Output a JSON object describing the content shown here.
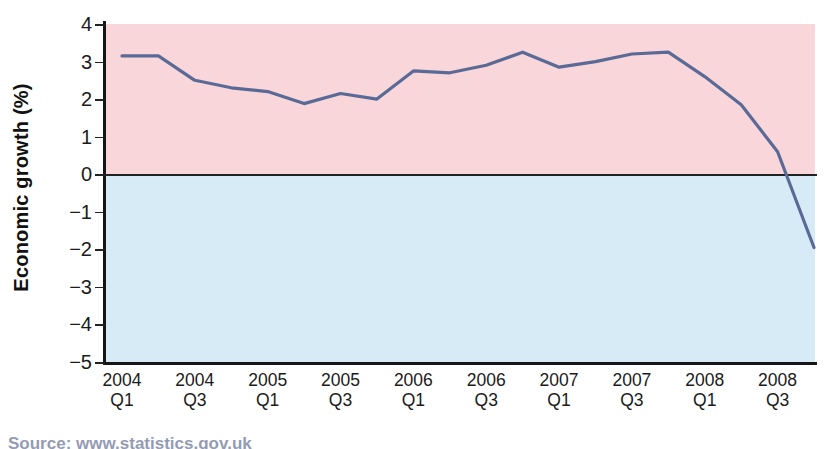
{
  "chart_data": {
    "type": "line",
    "title": "",
    "subtitle": "",
    "xlabel": "",
    "ylabel": "Economic growth (%)",
    "ylim": [
      -5,
      4
    ],
    "yticks": [
      4,
      3,
      2,
      1,
      0,
      -1,
      -2,
      -3,
      -4,
      -5
    ],
    "ytick_labels": [
      "4",
      "3",
      "2",
      "1",
      "0",
      "−1",
      "−2",
      "−3",
      "−4",
      "−5"
    ],
    "grid": false,
    "legend": "none",
    "zero_reference_line": true,
    "bands": [
      {
        "name": "positive-growth-band",
        "from": 0,
        "to": 4,
        "color": "#f9d6da"
      },
      {
        "name": "negative-growth-band",
        "from": -5,
        "to": 0,
        "color": "#d6ebf6"
      }
    ],
    "xtick_labels": [
      {
        "year": "2004",
        "quarter": "Q1"
      },
      {
        "year": "2004",
        "quarter": "Q3"
      },
      {
        "year": "2005",
        "quarter": "Q1"
      },
      {
        "year": "2005",
        "quarter": "Q3"
      },
      {
        "year": "2006",
        "quarter": "Q1"
      },
      {
        "year": "2006",
        "quarter": "Q3"
      },
      {
        "year": "2007",
        "quarter": "Q1"
      },
      {
        "year": "2007",
        "quarter": "Q3"
      },
      {
        "year": "2008",
        "quarter": "Q1"
      },
      {
        "year": "2008",
        "quarter": "Q3"
      }
    ],
    "x": [
      "2004 Q1",
      "2004 Q2",
      "2004 Q3",
      "2004 Q4",
      "2005 Q1",
      "2005 Q2",
      "2005 Q3",
      "2005 Q4",
      "2006 Q1",
      "2006 Q2",
      "2006 Q3",
      "2006 Q4",
      "2007 Q1",
      "2007 Q2",
      "2007 Q3",
      "2007 Q4",
      "2008 Q1",
      "2008 Q2",
      "2008 Q3",
      "2008 Q4"
    ],
    "series": [
      {
        "name": "Economic growth",
        "color": "#5a6a96",
        "values": [
          3.15,
          3.15,
          2.5,
          2.3,
          2.2,
          1.88,
          2.15,
          2.0,
          2.75,
          2.7,
          2.9,
          3.25,
          2.85,
          3.0,
          3.2,
          3.25,
          2.6,
          1.85,
          0.6,
          -1.95
        ]
      }
    ],
    "annotations": []
  },
  "axis": {
    "y_title": "Economic growth (%)"
  },
  "caption": {
    "source": "Source: www.statistics.gov.uk"
  }
}
